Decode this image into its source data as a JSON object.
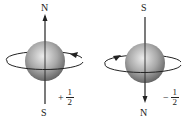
{
  "diagram": {
    "panels": [
      {
        "top_label": "N",
        "bottom_label": "S",
        "spin_sign": "+",
        "spin_numerator": "1",
        "spin_denominator": "2",
        "rotation": "counterclockwise (arrow on right pointing up-left)",
        "axis_arrow": "up"
      },
      {
        "top_label": "S",
        "bottom_label": "N",
        "spin_sign": "−",
        "spin_numerator": "1",
        "spin_denominator": "2",
        "rotation": "clockwise (arrow on left pointing up-right)",
        "axis_arrow": "down"
      }
    ],
    "colors": {
      "sphere_light": "#e6e6e6",
      "sphere_dark": "#6e6e6e",
      "line": "#222222"
    }
  }
}
